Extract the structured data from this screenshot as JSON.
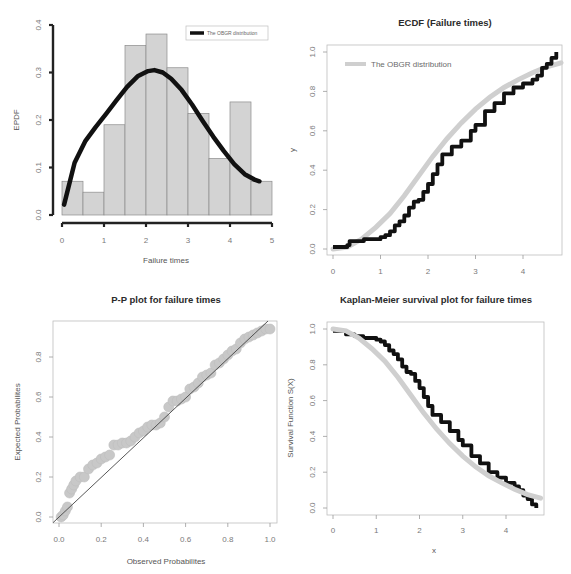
{
  "chart_data": [
    {
      "type": "bar",
      "id": "histogram",
      "title": "",
      "xlabel": "Failure times",
      "ylabel": "EPDF",
      "xlim": [
        0,
        5
      ],
      "ylim": [
        0,
        0.4
      ],
      "xticks": [
        "0",
        "1",
        "2",
        "3",
        "4",
        "5"
      ],
      "yticks": [
        "0.0",
        "0.1",
        "0.2",
        "0.3",
        "0.4"
      ],
      "bin_width": 0.5,
      "bin_edges": [
        0,
        0.5,
        1.0,
        1.5,
        2.0,
        2.5,
        3.0,
        3.5,
        4.0,
        4.5,
        5.0
      ],
      "values": [
        0.071,
        0.048,
        0.19,
        0.357,
        0.381,
        0.31,
        0.214,
        0.119,
        0.238,
        0.071
      ],
      "bar_color": "#d3d3d3",
      "legend": {
        "position": "topright",
        "entries": [
          "The OBGR distribution"
        ]
      },
      "series": [
        {
          "name": "The OBGR distribution",
          "type": "line",
          "color": "#111111",
          "x": [
            0.05,
            0.3,
            0.55,
            0.8,
            1.05,
            1.3,
            1.55,
            1.8,
            2.05,
            2.2,
            2.4,
            2.6,
            2.85,
            3.1,
            3.35,
            3.6,
            3.85,
            4.1,
            4.35,
            4.6,
            4.7
          ],
          "y": [
            0.022,
            0.11,
            0.155,
            0.185,
            0.213,
            0.242,
            0.27,
            0.292,
            0.303,
            0.305,
            0.3,
            0.287,
            0.263,
            0.232,
            0.198,
            0.165,
            0.135,
            0.107,
            0.086,
            0.074,
            0.071
          ]
        }
      ]
    },
    {
      "type": "line",
      "id": "ecdf",
      "title": "ECDF (Failure times)",
      "xlabel": "",
      "ylabel": "y",
      "xlim": [
        -0.1,
        4.8
      ],
      "ylim": [
        -0.02,
        1.02
      ],
      "xticks": [
        "0",
        "1",
        "2",
        "3",
        "4"
      ],
      "yticks": [
        "0.0",
        "0.2",
        "0.4",
        "0.6",
        "0.8",
        "1.0"
      ],
      "legend": {
        "position": "topleft",
        "entries": [
          "The OBGR distribution"
        ]
      },
      "series": [
        {
          "name": "Empirical CDF",
          "type": "step",
          "color": "#111111",
          "x": [
            0.0,
            0.3,
            0.35,
            0.5,
            0.65,
            0.8,
            1.0,
            1.1,
            1.2,
            1.3,
            1.4,
            1.5,
            1.6,
            1.7,
            1.8,
            1.9,
            2.0,
            2.1,
            2.2,
            2.3,
            2.5,
            2.7,
            2.9,
            3.0,
            3.2,
            3.4,
            3.6,
            3.8,
            4.0,
            4.2,
            4.3,
            4.4,
            4.5,
            4.6,
            4.7
          ],
          "y": [
            0.01,
            0.02,
            0.04,
            0.04,
            0.05,
            0.05,
            0.06,
            0.07,
            0.09,
            0.12,
            0.14,
            0.17,
            0.21,
            0.24,
            0.25,
            0.29,
            0.33,
            0.38,
            0.43,
            0.48,
            0.52,
            0.55,
            0.6,
            0.63,
            0.7,
            0.74,
            0.79,
            0.82,
            0.84,
            0.86,
            0.88,
            0.92,
            0.94,
            0.97,
            1.0
          ]
        },
        {
          "name": "The OBGR distribution",
          "type": "line",
          "color": "#cfcfcf",
          "x": [
            0.0,
            0.3,
            0.6,
            0.9,
            1.2,
            1.5,
            1.8,
            2.1,
            2.4,
            2.7,
            3.0,
            3.3,
            3.6,
            3.9,
            4.2,
            4.5,
            4.8
          ],
          "y": [
            0.0,
            0.01,
            0.05,
            0.11,
            0.18,
            0.27,
            0.37,
            0.47,
            0.56,
            0.64,
            0.71,
            0.77,
            0.82,
            0.86,
            0.895,
            0.925,
            0.945
          ]
        }
      ]
    },
    {
      "type": "scatter",
      "id": "pp-plot",
      "title": "P-P plot for failure times",
      "xlabel": "Observed Probabilites",
      "ylabel": "Expected Probabilites",
      "xlim": [
        -0.02,
        1.02
      ],
      "ylim": [
        -0.02,
        0.98
      ],
      "xticks": [
        "0.0",
        "0.2",
        "0.4",
        "0.6",
        "0.8",
        "1.0"
      ],
      "yticks": [
        "0.0",
        "0.2",
        "0.4",
        "0.6",
        "0.8"
      ],
      "reference_line": {
        "slope": 1,
        "intercept": 0,
        "color": "#444444"
      },
      "series": [
        {
          "name": "P-P points",
          "type": "scatter",
          "color": "#c8c8c8",
          "x": [
            0.01,
            0.02,
            0.03,
            0.04,
            0.05,
            0.06,
            0.07,
            0.08,
            0.1,
            0.12,
            0.14,
            0.16,
            0.18,
            0.2,
            0.22,
            0.24,
            0.26,
            0.28,
            0.3,
            0.32,
            0.34,
            0.36,
            0.38,
            0.4,
            0.42,
            0.44,
            0.46,
            0.48,
            0.5,
            0.52,
            0.54,
            0.56,
            0.58,
            0.6,
            0.62,
            0.64,
            0.66,
            0.68,
            0.7,
            0.72,
            0.74,
            0.76,
            0.78,
            0.8,
            0.82,
            0.84,
            0.86,
            0.88,
            0.9,
            0.92,
            0.94,
            0.96,
            0.98,
            1.0
          ],
          "y": [
            0.0,
            0.01,
            0.03,
            0.05,
            0.12,
            0.14,
            0.16,
            0.18,
            0.2,
            0.2,
            0.24,
            0.26,
            0.27,
            0.29,
            0.3,
            0.31,
            0.36,
            0.36,
            0.37,
            0.37,
            0.38,
            0.4,
            0.42,
            0.43,
            0.45,
            0.46,
            0.46,
            0.47,
            0.5,
            0.55,
            0.58,
            0.58,
            0.59,
            0.6,
            0.64,
            0.65,
            0.67,
            0.7,
            0.71,
            0.72,
            0.76,
            0.77,
            0.79,
            0.81,
            0.83,
            0.84,
            0.87,
            0.89,
            0.9,
            0.91,
            0.92,
            0.93,
            0.94,
            0.94
          ]
        }
      ]
    },
    {
      "type": "line",
      "id": "kaplan-meier",
      "title": "Kaplan-Meier survival plot for failure times",
      "xlabel": "x",
      "ylabel": "Survival Function S(X)",
      "xlim": [
        -0.1,
        4.9
      ],
      "ylim": [
        -0.02,
        1.02
      ],
      "xticks": [
        "0",
        "1",
        "2",
        "3",
        "4"
      ],
      "yticks": [
        "0.0",
        "0.2",
        "0.4",
        "0.6",
        "0.8",
        "1.0"
      ],
      "series": [
        {
          "name": "Kaplan-Meier estimate",
          "type": "step",
          "color": "#111111",
          "x": [
            0.0,
            0.3,
            0.5,
            0.7,
            1.0,
            1.1,
            1.2,
            1.3,
            1.4,
            1.5,
            1.6,
            1.7,
            1.8,
            1.9,
            2.0,
            2.1,
            2.2,
            2.3,
            2.5,
            2.7,
            2.9,
            3.0,
            3.2,
            3.4,
            3.6,
            3.8,
            4.0,
            4.2,
            4.3,
            4.4,
            4.5,
            4.6,
            4.7
          ],
          "y": [
            0.99,
            0.97,
            0.96,
            0.95,
            0.94,
            0.93,
            0.91,
            0.88,
            0.86,
            0.83,
            0.79,
            0.76,
            0.75,
            0.71,
            0.67,
            0.62,
            0.57,
            0.52,
            0.48,
            0.43,
            0.38,
            0.35,
            0.29,
            0.25,
            0.2,
            0.17,
            0.14,
            0.12,
            0.1,
            0.07,
            0.05,
            0.02,
            0.0
          ]
        },
        {
          "name": "The OBGR distribution",
          "type": "line",
          "color": "#cfcfcf",
          "x": [
            0.0,
            0.3,
            0.6,
            0.9,
            1.2,
            1.5,
            1.8,
            2.1,
            2.4,
            2.7,
            3.0,
            3.3,
            3.6,
            3.9,
            4.2,
            4.5,
            4.8
          ],
          "y": [
            1.0,
            0.99,
            0.95,
            0.89,
            0.82,
            0.73,
            0.63,
            0.53,
            0.44,
            0.36,
            0.29,
            0.23,
            0.18,
            0.14,
            0.105,
            0.075,
            0.055
          ]
        }
      ]
    }
  ],
  "panels": {
    "histogram": {
      "xlabel": "Failure times",
      "ylabel": "EPDF",
      "legend_label": "The OBGR distribution"
    },
    "ecdf": {
      "title": "ECDF (Failure times)",
      "ylabel": "y",
      "legend_label": "The OBGR distribution"
    },
    "pp": {
      "title": "P-P plot for failure times",
      "xlabel": "Observed Probabilites",
      "ylabel": "Expected Probabilites"
    },
    "km": {
      "title": "Kaplan-Meier survival plot for failure times",
      "xlabel": "x",
      "ylabel": "Survival Function S(X)"
    }
  }
}
